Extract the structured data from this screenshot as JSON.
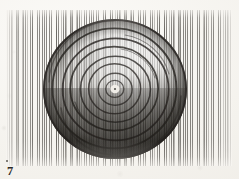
{
  "plate": {
    "figure_number": "7",
    "caption_text": "7",
    "medium_note": "pen-and-ink vertical hatching",
    "paper_color": "#f4f2ed",
    "ink_color": "#3a3732"
  },
  "artwork": {
    "title": "",
    "subject": "concentric rings disc",
    "center_x": 109,
    "center_y": 80,
    "outer_radius": 72,
    "ring_count": 8,
    "rings": [
      {
        "index": 1,
        "radius_x": 71,
        "radius_y": 69,
        "weight": 2.1,
        "opacity": 0.82
      },
      {
        "index": 2,
        "radius_x": 62,
        "radius_y": 60,
        "weight": 1.9,
        "opacity": 0.8
      },
      {
        "index": 3,
        "radius_x": 53,
        "radius_y": 51,
        "weight": 1.8,
        "opacity": 0.78
      },
      {
        "index": 4,
        "radius_x": 44,
        "radius_y": 42,
        "weight": 1.7,
        "opacity": 0.76
      },
      {
        "index": 5,
        "radius_x": 35,
        "radius_y": 33,
        "weight": 1.6,
        "opacity": 0.74
      },
      {
        "index": 6,
        "radius_x": 26,
        "radius_y": 25,
        "weight": 1.5,
        "opacity": 0.72
      },
      {
        "index": 7,
        "radius_x": 17,
        "radius_y": 16,
        "weight": 1.4,
        "opacity": 0.7
      },
      {
        "index": 8,
        "radius_x": 9,
        "radius_y": 8.5,
        "weight": 1.3,
        "opacity": 0.68
      }
    ],
    "nucleus": {
      "radius": 4,
      "dot_radius": 0.9,
      "fill": "#f2efe9"
    },
    "shading": {
      "light_quadrant": "top-right",
      "dark_quadrant": "bottom-right",
      "darkest_value": "#2a2723",
      "lightest_value": "#efece6"
    }
  }
}
